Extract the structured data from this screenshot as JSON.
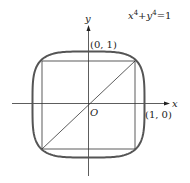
{
  "diagram": {
    "equation": {
      "x_term": "x",
      "x_exp": "4",
      "plus": "+",
      "y_term": "y",
      "y_exp": "4",
      "rhs": "=1"
    },
    "axes": {
      "x_label": "x",
      "y_label": "y",
      "origin_label": "O"
    },
    "points": [
      {
        "label": "(0, 1)",
        "x": 0,
        "y": 1
      },
      {
        "label": "(1, 0)",
        "x": 1,
        "y": 0
      }
    ],
    "shapes": [
      "curve x^4+y^4=1",
      "inscribed square with vertices at (±0.84, ±0.84)",
      "diagonal from (-0.84,-0.84) to (0.84,0.84)"
    ],
    "colors": {
      "curve": "#555555",
      "lines": "#333333"
    }
  }
}
